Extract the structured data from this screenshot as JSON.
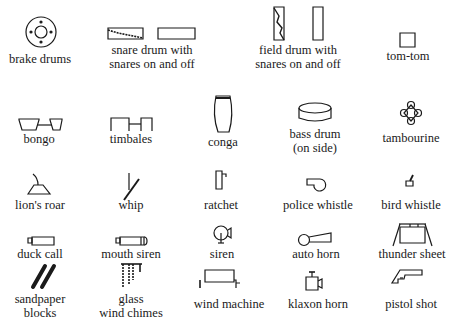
{
  "instruments": [
    {
      "id": "brake-drums",
      "label_lines": [
        "brake drums"
      ]
    },
    {
      "id": "snare-drum",
      "label_lines": [
        "snare drum with",
        "snares on and off"
      ]
    },
    {
      "id": "field-drum",
      "label_lines": [
        "field drum with",
        "snares on and off"
      ]
    },
    {
      "id": "tom-tom",
      "label_lines": [
        "tom-tom"
      ]
    },
    {
      "id": "bongo",
      "label_lines": [
        "bongo"
      ]
    },
    {
      "id": "timbales",
      "label_lines": [
        "timbales"
      ]
    },
    {
      "id": "conga",
      "label_lines": [
        "conga"
      ]
    },
    {
      "id": "bass-drum",
      "label_lines": [
        "bass drum",
        "(on side)"
      ]
    },
    {
      "id": "tambourine",
      "label_lines": [
        "tambourine"
      ]
    },
    {
      "id": "lions-roar",
      "label_lines": [
        "lion's roar"
      ]
    },
    {
      "id": "whip",
      "label_lines": [
        "whip"
      ]
    },
    {
      "id": "ratchet",
      "label_lines": [
        "ratchet"
      ]
    },
    {
      "id": "police-whistle",
      "label_lines": [
        "police whistle"
      ]
    },
    {
      "id": "bird-whistle",
      "label_lines": [
        "bird whistle"
      ]
    },
    {
      "id": "duck-call",
      "label_lines": [
        "duck call"
      ]
    },
    {
      "id": "mouth-siren",
      "label_lines": [
        "mouth siren"
      ]
    },
    {
      "id": "siren",
      "label_lines": [
        "siren"
      ]
    },
    {
      "id": "auto-horn",
      "label_lines": [
        "auto horn"
      ]
    },
    {
      "id": "thunder-sheet",
      "label_lines": [
        "thunder sheet"
      ]
    },
    {
      "id": "sandpaper-blocks",
      "label_lines": [
        "sandpaper",
        "blocks"
      ]
    },
    {
      "id": "glass-wind-chimes",
      "label_lines": [
        "glass",
        "wind chimes"
      ]
    },
    {
      "id": "wind-machine",
      "label_lines": [
        "wind machine"
      ]
    },
    {
      "id": "klaxon-horn",
      "label_lines": [
        "klaxon horn"
      ]
    },
    {
      "id": "pistol-shot",
      "label_lines": [
        "pistol shot"
      ]
    }
  ]
}
